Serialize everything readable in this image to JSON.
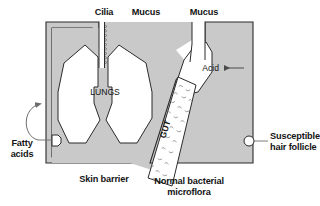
{
  "figure": {
    "colors": {
      "body_fill": "#c9c9c9",
      "body_outline": "#2b2b2b",
      "cavity_fill": "#ffffff",
      "text": "#141414",
      "leader_line": "#555555",
      "bacteria": "#8c8c8c",
      "page_background": "#ffffff"
    }
  },
  "labels": {
    "cilia": "Cilia",
    "mucus_left": "Mucus",
    "mucus_right": "Mucus",
    "lungs": "LUNGS",
    "acid": "Acid",
    "gut": "GUT",
    "fatty_acids_line1": "Fatty",
    "fatty_acids_line2": "acids",
    "skin_barrier": "Skin barrier",
    "microflora_line1": "Normal bacterial",
    "microflora_line2": "microflora",
    "follicle_line1": "Susceptible",
    "follicle_line2": "hair follicle"
  },
  "markers": {
    "acid_arrow": "arrow-left-icon",
    "fatty_acids_arrow": "curved-arrow-icon",
    "skin_pore": "pore-marker-icon",
    "hair_follicle": "follicle-marker-icon",
    "cilia_fringe": "cilia-fringe-icon",
    "bacteria_flecks": "bacteria-flecks-icon"
  }
}
